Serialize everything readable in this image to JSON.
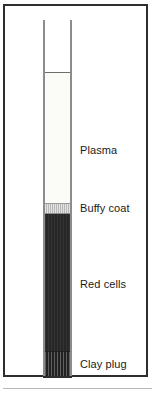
{
  "figure": {
    "border_color": "#2d2d2d",
    "background_color": "#ffffff"
  },
  "tube": {
    "name": "capillary-tube",
    "wall_color": "#8c8c8c",
    "bottom_cap_color": "#2d2d2d",
    "meniscus_color": "#6e6e6e"
  },
  "layers": [
    {
      "key": "air",
      "label": "",
      "color": "#ffffff",
      "texture": "none"
    },
    {
      "key": "plasma",
      "label": "Plasma",
      "color": "#fbfbf8",
      "texture": "none"
    },
    {
      "key": "buffy_coat",
      "label": "Buffy coat",
      "color": "#c2c2c2",
      "texture": "vertical-stripes"
    },
    {
      "key": "red_cells",
      "label": "Red cells",
      "color": "#2b2b2b",
      "texture": "vertical-stripes"
    },
    {
      "key": "clay_plug",
      "label": "Clay plug",
      "color": "#333333",
      "texture": "vertical-stripes"
    }
  ]
}
